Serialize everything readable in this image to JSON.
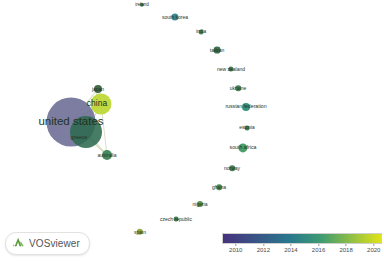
{
  "app": {
    "name": "VOSviewer",
    "logo_icon": "vosviewer-mountain-icon"
  },
  "visualization": {
    "type": "network-overlay-map",
    "width": 384,
    "height": 261,
    "background_color": "#ffffff",
    "label_color": "#23331f"
  },
  "legend": {
    "title": "",
    "ticks": [
      "2010",
      "2012",
      "2014",
      "2016",
      "2018",
      "2020"
    ],
    "gradient_start_color": "#46327e",
    "gradient_mid_color": "#2a788e",
    "gradient_green_color": "#3e9b72",
    "gradient_end_color": "#e0e318",
    "min_year": 2009,
    "max_year": 2020.6
  },
  "chart_data": {
    "type": "scatter",
    "title": "",
    "xlabel": "",
    "ylabel": "",
    "colormap": "viridis",
    "color_variable": "average publication year",
    "size_variable": "number of documents",
    "nodes": [
      {
        "label": "united states",
        "x": 71,
        "y": 122,
        "r": 24.5,
        "color": "#6b6b94",
        "year": 2012.4,
        "font_size": 11.5,
        "label_dx": 0,
        "label_dy": 0
      },
      {
        "label": "china",
        "x": 101,
        "y": 104,
        "r": 10.5,
        "color": "#b9d629",
        "year": 2019.4,
        "font_size": 8.5,
        "label_dx": -4,
        "label_dy": -1
      },
      {
        "label": "greece",
        "x": 86,
        "y": 132,
        "r": 16.0,
        "color": "#2d6a50",
        "year": 2015.2,
        "font_size": 5.5,
        "label_dx": -7,
        "label_dy": 6
      },
      {
        "label": "japan",
        "x": 98,
        "y": 89,
        "r": 4.0,
        "color": "#37633f",
        "year": 2014.4,
        "font_size": 5.0,
        "label_dx": 0,
        "label_dy": -0.5
      },
      {
        "label": "australia",
        "x": 107,
        "y": 155,
        "r": 5.0,
        "color": "#3d8455",
        "year": 2016.0,
        "font_size": 5.0,
        "label_dx": 0,
        "label_dy": 0
      },
      {
        "label": "ireland",
        "x": 142,
        "y": 5,
        "r": 2.2,
        "color": "#3b7d52",
        "year": 2015.7,
        "font_size": 4.5,
        "label_dx": 0,
        "label_dy": 0
      },
      {
        "label": "south korea",
        "x": 175,
        "y": 17,
        "r": 3.6,
        "color": "#35848a",
        "year": 2013.8,
        "font_size": 5.0,
        "label_dx": 0,
        "label_dy": 0
      },
      {
        "label": "india",
        "x": 201,
        "y": 32,
        "r": 2.4,
        "color": "#3f7f4f",
        "year": 2015.3,
        "font_size": 4.8,
        "label_dx": 0,
        "label_dy": 0
      },
      {
        "label": "taiwan",
        "x": 217,
        "y": 50,
        "r": 3.4,
        "color": "#2f6a48",
        "year": 2014.8,
        "font_size": 5.0,
        "label_dx": 0,
        "label_dy": 0
      },
      {
        "label": "new zealand",
        "x": 231,
        "y": 69,
        "r": 2.6,
        "color": "#37764c",
        "year": 2015.5,
        "font_size": 5.0,
        "label_dx": 0,
        "label_dy": 0
      },
      {
        "label": "ukraine",
        "x": 238,
        "y": 88,
        "r": 2.8,
        "color": "#3c7f52",
        "year": 2015.6,
        "font_size": 5.0,
        "label_dx": 0,
        "label_dy": 0
      },
      {
        "label": "russian federation",
        "x": 246,
        "y": 107,
        "r": 4.0,
        "color": "#2f8f77",
        "year": 2016.4,
        "font_size": 5.2,
        "label_dx": 0,
        "label_dy": 0
      },
      {
        "label": "estonia",
        "x": 247,
        "y": 128,
        "r": 2.4,
        "color": "#3b7a4e",
        "year": 2015.4,
        "font_size": 4.8,
        "label_dx": 0,
        "label_dy": 0
      },
      {
        "label": "south africa",
        "x": 243,
        "y": 148,
        "r": 4.6,
        "color": "#3f9b63",
        "year": 2016.8,
        "font_size": 5.2,
        "label_dx": 0,
        "label_dy": 0
      },
      {
        "label": "norway",
        "x": 232,
        "y": 168,
        "r": 2.8,
        "color": "#3d7b50",
        "year": 2015.5,
        "font_size": 5.0,
        "label_dx": 0,
        "label_dy": 0
      },
      {
        "label": "ghana",
        "x": 219,
        "y": 187,
        "r": 2.8,
        "color": "#41864f",
        "year": 2016.0,
        "font_size": 5.0,
        "label_dx": 0,
        "label_dy": 0
      },
      {
        "label": "nigeria",
        "x": 200,
        "y": 204,
        "r": 3.0,
        "color": "#4f8d3e",
        "year": 2016.6,
        "font_size": 5.0,
        "label_dx": 0,
        "label_dy": 0
      },
      {
        "label": "czech republic",
        "x": 176,
        "y": 219,
        "r": 2.4,
        "color": "#3c7a4e",
        "year": 2015.4,
        "font_size": 5.0,
        "label_dx": 0,
        "label_dy": 0
      },
      {
        "label": "spain",
        "x": 140,
        "y": 232,
        "r": 3.2,
        "color": "#8aa82e",
        "year": 2018.2,
        "font_size": 5.0,
        "label_dx": 0,
        "label_dy": 0
      }
    ],
    "edges": [
      {
        "source": "united states",
        "target": "china",
        "weight": 1.0
      },
      {
        "source": "united states",
        "target": "greece",
        "weight": 1.0
      },
      {
        "source": "united states",
        "target": "japan",
        "weight": 0.6
      },
      {
        "source": "united states",
        "target": "australia",
        "weight": 0.6
      },
      {
        "source": "china",
        "target": "japan",
        "weight": 0.7
      },
      {
        "source": "china",
        "target": "greece",
        "weight": 0.7
      },
      {
        "source": "china",
        "target": "australia",
        "weight": 0.5
      },
      {
        "source": "greece",
        "target": "australia",
        "weight": 0.6
      },
      {
        "source": "greece",
        "target": "japan",
        "weight": 0.4
      }
    ]
  }
}
